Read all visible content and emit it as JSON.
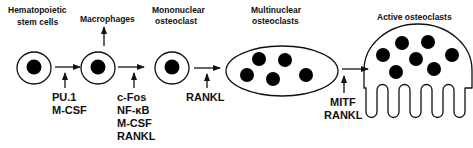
{
  "diagram": {
    "stages": [
      {
        "id": "hsc",
        "label_lines": [
          "Hematopoietic",
          "stem cells"
        ],
        "nuclei": 1
      },
      {
        "id": "precursor",
        "label_lines": [],
        "nuclei": 1
      },
      {
        "id": "mononuclear",
        "label_lines": [
          "Mononuclear",
          "osteoclast"
        ],
        "nuclei": 1
      },
      {
        "id": "multinuclear",
        "label_lines": [
          "Multinuclear",
          "osteoclasts"
        ],
        "nuclei": 5
      },
      {
        "id": "active",
        "label_lines": [
          "Active osteoclasts"
        ],
        "nuclei": 7
      }
    ],
    "branch": {
      "label": "Macrophages"
    },
    "transitions": [
      {
        "from": "hsc",
        "to": "precursor",
        "factors": [
          "PU.1",
          "M-CSF"
        ]
      },
      {
        "from": "precursor",
        "to": "mononuclear",
        "factors": [
          "c-Fos",
          "NF-κB",
          "M-CSF",
          "RANKL"
        ]
      },
      {
        "from": "mononuclear",
        "to": "multinuclear",
        "factors": [
          "RANKL"
        ]
      },
      {
        "from": "multinuclear",
        "to": "active",
        "factors": [
          "MITF",
          "RANKL"
        ]
      }
    ],
    "colors": {
      "stroke": "#111111",
      "fill": "#000000",
      "background": "#ffffff"
    }
  }
}
